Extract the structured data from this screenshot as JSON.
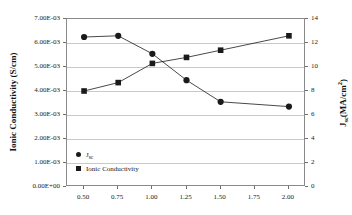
{
  "chart_data": {
    "type": "line",
    "title": "",
    "xlabel": "",
    "x": [
      0.5,
      0.75,
      1.0,
      1.25,
      1.5,
      2.0
    ],
    "xlim": [
      0.375,
      2.125
    ],
    "xticks": [
      0.5,
      0.75,
      1.0,
      1.25,
      1.5,
      1.75,
      2.0
    ],
    "xtick_labels": [
      "0.50",
      "0.75",
      "1.00",
      "1.25",
      "1.50",
      "1.75",
      "2.00"
    ],
    "grid": true,
    "legend_position": "lower-left",
    "axes": {
      "left": {
        "label": "Ionic Conductivity (S/cm)",
        "ylim": [
          0,
          0.007
        ],
        "ticks": [
          0,
          0.001,
          0.002,
          0.003,
          0.004,
          0.005,
          0.006,
          0.007
        ],
        "tick_labels": [
          "0.00E+00",
          "1.00E-03",
          "2.00E-03",
          "3.00E-03",
          "4.00E-03",
          "5.00E-03",
          "6.00E-03",
          "7.00E-03"
        ]
      },
      "right": {
        "label_main": "J",
        "label_sub": "sc",
        "label_unit": "(MA/cm",
        "label_sup": "2",
        "label_tail": ")",
        "label_plain": "Jsc(MA/cm2)",
        "ylim": [
          0,
          14
        ],
        "ticks": [
          0,
          2,
          4,
          6,
          8,
          10,
          12,
          14
        ],
        "tick_labels": [
          "0",
          "2",
          "4",
          "6",
          "8",
          "10",
          "12",
          "14"
        ]
      }
    },
    "series": [
      {
        "name": "Jsc",
        "legend_label_main": "J",
        "legend_label_sub": "sc",
        "marker": "circle",
        "axis": "right",
        "color": "#1a1a1a",
        "values": [
          12.5,
          12.6,
          11.1,
          8.9,
          7.1,
          6.7
        ]
      },
      {
        "name": "Ionic Conductivity",
        "legend_label_main": "Ionic Conductivity",
        "legend_label_sub": "",
        "marker": "square",
        "axis": "left",
        "color": "#1a1a1a",
        "values": [
          0.004,
          0.00435,
          0.00515,
          0.0054,
          0.0057,
          0.0063
        ]
      }
    ]
  },
  "colors": {
    "frame": "#8a8a8a",
    "grid": "#c9c9c9",
    "ink": "#1a1a1a",
    "background": "#ffffff"
  }
}
